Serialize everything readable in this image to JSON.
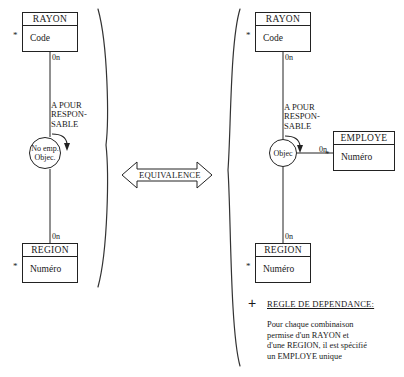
{
  "diagram": {
    "equivalence_label": "EQUIVALENCE",
    "plus_symbol": "+",
    "star_symbol": "*"
  },
  "left_model": {
    "entities": [
      {
        "name": "RAYON",
        "attribute": "Code",
        "identifier_marker": "*",
        "cardinality_below": "0n"
      },
      {
        "name": "REGION",
        "attribute": "Numéro",
        "identifier_marker": "*",
        "cardinality_above": "0n"
      }
    ],
    "relationship": {
      "label_line1": "A POUR",
      "label_line2": "RESPON-",
      "label_line3": "SABLE",
      "circle_line1": "No emp.",
      "circle_line2": "Objec."
    }
  },
  "right_model": {
    "entities": [
      {
        "name": "RAYON",
        "attribute": "Code",
        "identifier_marker": "*",
        "cardinality_below": "0n"
      },
      {
        "name": "REGION",
        "attribute": "Numéro",
        "identifier_marker": "*",
        "cardinality_above": "0n"
      },
      {
        "name": "EMPLOYE",
        "attribute": "Numéro",
        "identifier_marker": "*",
        "cardinality_left": "0n"
      }
    ],
    "relationship": {
      "label_line1": "A POUR",
      "label_line2": "RESPON-",
      "label_line3": "SABLE",
      "circle_line1": "Objec"
    },
    "rule": {
      "title": "REGLE DE DEPENDANCE:",
      "body": "Pour chaque combinaison\npermise d'un RAYON et\nd'une REGION, il est spécifié\nun EMPLOYE unique"
    }
  }
}
